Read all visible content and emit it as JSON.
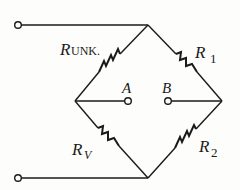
{
  "diagram": {
    "type": "wheatstone-bridge",
    "labels": {
      "r_unk_main": "R",
      "r_unk_sub": "UNK.",
      "r1_main": "R",
      "r1_sub": "1",
      "r2_main": "R",
      "r2_sub": "2",
      "rv_main": "R",
      "rv_sub": "V",
      "node_a": "A",
      "node_b": "B"
    },
    "components": [
      {
        "name": "R_UNK.",
        "branch": "top-to-left"
      },
      {
        "name": "R_1",
        "branch": "top-to-right"
      },
      {
        "name": "R_V",
        "branch": "left-to-bottom"
      },
      {
        "name": "R_2",
        "branch": "right-to-bottom"
      }
    ],
    "terminals": [
      "top-input",
      "bottom-input",
      "A",
      "B"
    ],
    "colors": {
      "ink": "#1a1a1a",
      "background": "#fdfdfb"
    }
  }
}
